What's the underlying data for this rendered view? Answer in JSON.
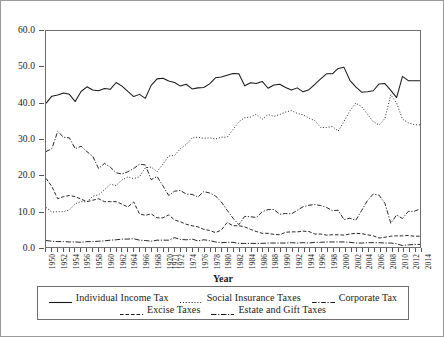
{
  "chart_data": {
    "type": "line",
    "title": "",
    "xlabel": "Year",
    "ylabel": "",
    "ylim": [
      0,
      60
    ],
    "yticks": [
      "0.0",
      "10.0",
      "20.0",
      "30.0",
      "40.0",
      "50.0",
      "60.0"
    ],
    "ytick_values": [
      0,
      10,
      20,
      30,
      40,
      50,
      60
    ],
    "grid": false,
    "legend_position": "bottom",
    "x": [
      1950,
      1951,
      1952,
      1953,
      1954,
      1955,
      1956,
      1957,
      1958,
      1959,
      1960,
      1961,
      1962,
      1963,
      1964,
      1965,
      1966,
      1967,
      1968,
      1969,
      1970,
      1971,
      1972,
      1973,
      1974,
      1975,
      1976,
      1977,
      1978,
      1979,
      1980,
      1981,
      1982,
      1983,
      1984,
      1985,
      1986,
      1987,
      1988,
      1989,
      1990,
      1991,
      1992,
      1993,
      1994,
      1995,
      1996,
      1997,
      1998,
      1999,
      2000,
      2001,
      2002,
      2003,
      2004,
      2005,
      2006,
      2007,
      2008,
      2009,
      2010,
      2011,
      2012,
      2013,
      2014
    ],
    "xtick_labels": [
      "1950",
      "1952",
      "1954",
      "1956",
      "1958",
      "1960",
      "1962",
      "1964",
      "1966",
      "1968",
      "1970",
      "1971",
      "1972",
      "1974",
      "1976",
      "1978",
      "1980",
      "1982",
      "1984",
      "1986",
      "1988",
      "1990",
      "1992",
      "1994",
      "1996",
      "1998",
      "2000",
      "2002",
      "2004",
      "2006",
      "2008",
      "2010",
      "2012",
      "2014"
    ],
    "series": [
      {
        "name": "Individual Income Tax",
        "style": "solid",
        "values": [
          39.9,
          41.9,
          42.2,
          42.8,
          42.4,
          40.4,
          43.2,
          44.5,
          43.6,
          43.4,
          44.0,
          43.8,
          45.7,
          44.7,
          43.2,
          41.8,
          42.4,
          41.3,
          44.9,
          46.7,
          46.9,
          46.1,
          45.7,
          44.7,
          45.2,
          43.9,
          44.2,
          44.3,
          45.3,
          47.0,
          47.2,
          47.7,
          48.2,
          48.1,
          44.8,
          45.6,
          45.4,
          46.0,
          44.1,
          45.0,
          45.2,
          44.3,
          43.6,
          44.2,
          43.1,
          43.7,
          45.2,
          46.7,
          48.1,
          48.1,
          49.6,
          49.9,
          46.3,
          44.5,
          43.0,
          43.1,
          43.4,
          45.3,
          45.4,
          43.5,
          41.5,
          47.4,
          46.2,
          46.2,
          46.2
        ]
      },
      {
        "name": "Social Insurance Taxes",
        "style": "dotted",
        "values": [
          11.0,
          9.7,
          9.8,
          9.8,
          10.3,
          12.0,
          12.6,
          12.5,
          14.1,
          14.5,
          15.9,
          17.4,
          17.1,
          18.6,
          19.5,
          19.0,
          19.5,
          22.0,
          22.2,
          20.9,
          23.0,
          25.3,
          25.4,
          27.3,
          28.5,
          30.3,
          30.5,
          30.2,
          30.3,
          30.0,
          30.5,
          30.5,
          32.6,
          34.8,
          35.9,
          36.1,
          36.9,
          35.5,
          36.8,
          36.3,
          36.8,
          37.5,
          37.9,
          37.1,
          36.7,
          35.8,
          35.1,
          33.2,
          33.2,
          33.5,
          32.2,
          34.9,
          37.8,
          40.0,
          39.0,
          36.9,
          34.8,
          33.9,
          35.7,
          42.3,
          40.0,
          35.5,
          34.5,
          34.0,
          33.9
        ]
      },
      {
        "name": "Corporate Tax",
        "style": "dashdot",
        "values": [
          26.5,
          27.3,
          32.1,
          30.5,
          30.3,
          27.3,
          28.0,
          26.5,
          25.2,
          21.8,
          23.2,
          22.2,
          20.6,
          20.3,
          20.9,
          21.8,
          23.0,
          22.8,
          18.7,
          19.6,
          17.0,
          14.3,
          15.5,
          15.7,
          14.7,
          14.6,
          13.9,
          15.4,
          15.0,
          14.2,
          12.5,
          10.2,
          8.0,
          6.2,
          8.5,
          8.4,
          8.2,
          9.8,
          10.4,
          10.4,
          9.1,
          9.3,
          9.2,
          10.2,
          11.2,
          11.6,
          11.8,
          11.5,
          11.0,
          10.1,
          10.2,
          7.6,
          8.0,
          7.4,
          10.1,
          12.9,
          14.7,
          14.4,
          12.1,
          6.6,
          8.9,
          7.9,
          9.9,
          9.9,
          10.6
        ]
      },
      {
        "name": "Excise Taxes",
        "style": "dashed",
        "values": [
          19.1,
          16.8,
          13.4,
          14.0,
          14.3,
          14.0,
          13.3,
          12.6,
          13.0,
          13.4,
          12.6,
          12.6,
          12.6,
          11.9,
          11.1,
          12.5,
          9.2,
          8.8,
          9.2,
          8.1,
          8.1,
          8.9,
          7.5,
          7.0,
          6.3,
          5.9,
          5.6,
          4.9,
          4.6,
          4.0,
          4.7,
          6.8,
          5.9,
          5.9,
          5.6,
          4.9,
          4.3,
          3.8,
          3.8,
          3.5,
          3.4,
          4.1,
          4.2,
          4.2,
          4.4,
          4.3,
          3.6,
          3.6,
          3.3,
          3.4,
          3.4,
          3.3,
          3.6,
          3.8,
          3.7,
          3.4,
          3.1,
          2.5,
          2.7,
          3.0,
          3.1,
          3.1,
          3.2,
          3.0,
          3.0
        ]
      },
      {
        "name": "Estate and Gift Taxes",
        "style": "dashdot2",
        "values": [
          1.8,
          1.6,
          1.5,
          1.5,
          1.4,
          1.4,
          1.3,
          1.5,
          1.5,
          1.6,
          1.7,
          1.9,
          2.0,
          2.2,
          2.2,
          2.3,
          1.9,
          1.8,
          1.6,
          1.9,
          1.9,
          1.9,
          2.6,
          2.1,
          2.0,
          2.2,
          1.7,
          2.0,
          1.8,
          1.4,
          1.2,
          1.3,
          1.3,
          1.0,
          1.0,
          1.0,
          1.0,
          1.0,
          1.1,
          1.1,
          1.1,
          1.1,
          1.2,
          1.1,
          1.2,
          1.1,
          1.3,
          1.3,
          1.4,
          1.4,
          1.4,
          1.4,
          1.3,
          1.1,
          1.1,
          1.2,
          1.2,
          1.2,
          1.1,
          1.1,
          0.9,
          0.4,
          0.6,
          0.7,
          0.7
        ]
      }
    ]
  },
  "legend": {
    "rows": [
      [
        {
          "label": "Individual Income Tax",
          "style": "solid"
        },
        {
          "label": "Social Insurance Taxes",
          "style": "dotted"
        },
        {
          "label": "Corporate Tax",
          "style": "dashdot"
        }
      ],
      [
        {
          "label": "Excise Taxes",
          "style": "dashed"
        },
        {
          "label": "Estate and Gift Taxes",
          "style": "dashdot2"
        }
      ]
    ]
  },
  "axis": {
    "x_title": "Year"
  },
  "colors": {
    "line": "#1a1a1a",
    "frame": "#6f6f6f",
    "outer_border": "#9a9a9a",
    "background": "#ffffff"
  }
}
